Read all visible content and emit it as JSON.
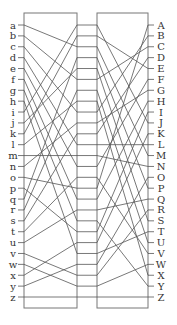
{
  "diagram": {
    "title": "",
    "left_labels": [
      "a",
      "b",
      "c",
      "d",
      "e",
      "f",
      "g",
      "h",
      "i",
      "j",
      "k",
      "l",
      "m",
      "n",
      "o",
      "p",
      "q",
      "r",
      "s",
      "t",
      "u",
      "v",
      "w",
      "x",
      "y",
      "z"
    ],
    "right_labels": [
      "A",
      "B",
      "C",
      "D",
      "E",
      "F",
      "G",
      "H",
      "I",
      "J",
      "K",
      "L",
      "M",
      "N",
      "O",
      "P",
      "Q",
      "R",
      "S",
      "T",
      "U",
      "V",
      "W",
      "X",
      "Y",
      "Z"
    ],
    "left_box_wiring": [
      2,
      5,
      8,
      11,
      13,
      16,
      18,
      21,
      0,
      4,
      1,
      7,
      12,
      9,
      15,
      19,
      3,
      6,
      10,
      14,
      17,
      23,
      24,
      20,
      22,
      25
    ],
    "right_box_wiring": [
      9,
      4,
      12,
      15,
      18,
      2,
      20,
      23,
      1,
      6,
      3,
      11,
      13,
      5,
      21,
      0,
      7,
      16,
      24,
      8,
      10,
      19,
      14,
      17,
      22,
      25
    ],
    "colors": {
      "line": "#555555",
      "frame": "#777777",
      "text": "#333333",
      "background": "#ffffff"
    }
  }
}
